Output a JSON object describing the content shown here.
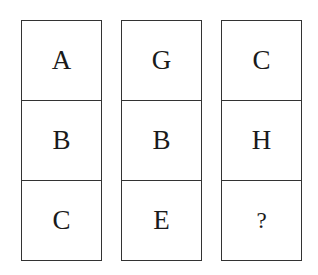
{
  "puzzle": {
    "columns": [
      {
        "cells": [
          "A",
          "B",
          "C"
        ]
      },
      {
        "cells": [
          "G",
          "B",
          "E"
        ]
      },
      {
        "cells": [
          "C",
          "H",
          "?"
        ]
      }
    ]
  },
  "colors": {
    "border": "#333333",
    "text": "#1a1a1a",
    "background": "#ffffff"
  }
}
